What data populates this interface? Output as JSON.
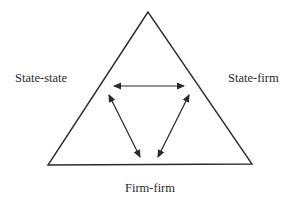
{
  "diagram": {
    "type": "triangle-relations",
    "labels": {
      "left": "State-state",
      "right": "State-firm",
      "bottom": "Firm-firm"
    },
    "colors": {
      "stroke": "#2a2a2a",
      "text": "#2a2a2a",
      "background": "#ffffff"
    },
    "arrows": [
      {
        "from": "left",
        "to": "right",
        "bidirectional": true
      },
      {
        "from": "left",
        "to": "bottom",
        "bidirectional": true
      },
      {
        "from": "right",
        "to": "bottom",
        "bidirectional": true
      }
    ]
  }
}
